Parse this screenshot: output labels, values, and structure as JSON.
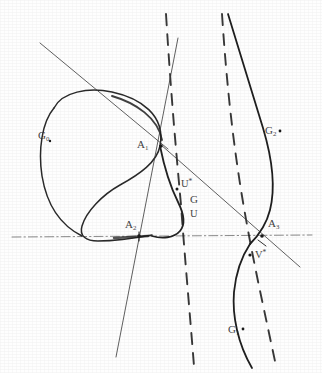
{
  "figure": {
    "background_color": "#fefefe",
    "ink_color": "#2a2a2a",
    "width": 322,
    "height": 373
  },
  "labels": {
    "g0": {
      "base": "G",
      "sub": "0",
      "x": 38,
      "y": 136
    },
    "g1": {
      "base": "G",
      "sub": "1",
      "x": 228,
      "y": 331
    },
    "g2": {
      "base": "G",
      "sub": "2",
      "x": 265,
      "y": 131
    },
    "g": {
      "base": "G",
      "sub": "",
      "x": 190,
      "y": 199
    },
    "a1": {
      "base": "A",
      "sub": "1",
      "x": 137,
      "y": 140
    },
    "a2": {
      "base": "A",
      "sub": "2",
      "x": 125,
      "y": 220
    },
    "a3": {
      "base": "A",
      "sub": "3",
      "x": 270,
      "y": 219
    },
    "u": {
      "base": "U",
      "sub": "",
      "x": 190,
      "y": 214
    },
    "ustar": {
      "base": "U",
      "star": "*",
      "x": 181,
      "y": 182
    },
    "vstar": {
      "base": "V",
      "star": "*",
      "x": 255,
      "y": 253
    }
  },
  "curves": {
    "g0_label": "G0 — closed oval branch, upper left",
    "g2_label": "G2 — right-hand convex branch, upper right",
    "g1_label": "G1 — right-hand branch continuing below the axis",
    "g_label": "G — small cuspidal arc near the centre"
  },
  "lines": {
    "axis": {
      "name": "horizontal-axis",
      "style": "dash-dot",
      "y": 236
    },
    "asymptote_left": {
      "name": "asymptote-left",
      "style": "dashed"
    },
    "asymptote_right": {
      "name": "asymptote-right",
      "style": "dashed"
    },
    "tangent_upper": {
      "name": "tangent-through-A1",
      "style": "solid"
    },
    "tangent_steep": {
      "name": "steep-line-through-A2",
      "style": "solid"
    },
    "secant_a1_a3": {
      "name": "secant-A1-A3",
      "style": "solid"
    }
  }
}
